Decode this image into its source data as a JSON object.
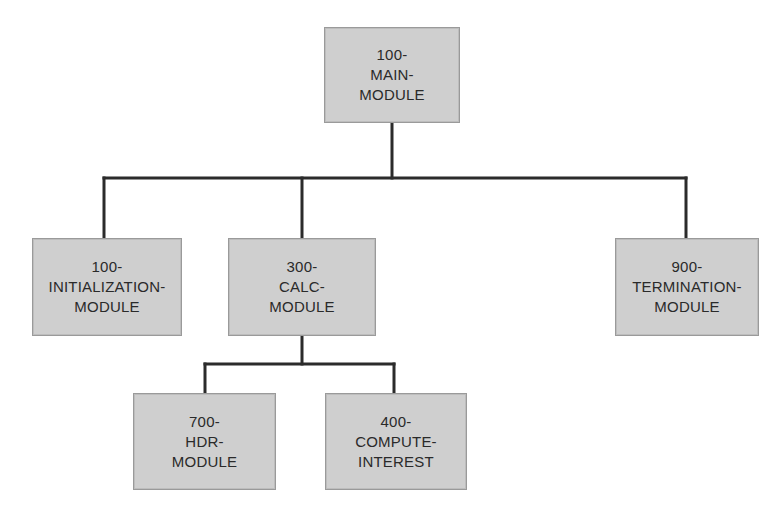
{
  "diagram": {
    "type": "hierarchy-chart",
    "nodes": {
      "main": {
        "lines": [
          "100-",
          "MAIN-",
          "MODULE"
        ]
      },
      "init": {
        "lines": [
          "100-",
          "INITIALIZATION-",
          "MODULE"
        ]
      },
      "calc": {
        "lines": [
          "300-",
          "CALC-",
          "MODULE"
        ]
      },
      "term": {
        "lines": [
          "900-",
          "TERMINATION-",
          "MODULE"
        ]
      },
      "hdr": {
        "lines": [
          "700-",
          "HDR-",
          "MODULE"
        ]
      },
      "interest": {
        "lines": [
          "400-",
          "COMPUTE-",
          "INTEREST"
        ]
      }
    },
    "edges": [
      [
        "main",
        "init"
      ],
      [
        "main",
        "calc"
      ],
      [
        "main",
        "term"
      ],
      [
        "calc",
        "hdr"
      ],
      [
        "calc",
        "interest"
      ]
    ]
  }
}
